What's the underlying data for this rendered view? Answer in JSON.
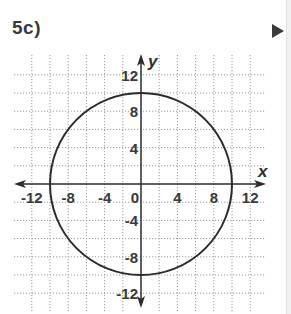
{
  "problem": {
    "label": "5c)"
  },
  "navigation": {
    "next_icon": "play-triangle-icon"
  },
  "chart_data": {
    "type": "line",
    "title": "5c)",
    "subtitle": "",
    "xlabel": "x",
    "ylabel": "y",
    "xlim": [
      -12,
      12
    ],
    "ylim": [
      -12,
      12
    ],
    "grid": true,
    "grid_step": 2,
    "x_ticks": [
      -12,
      -8,
      -4,
      0,
      4,
      8,
      12
    ],
    "x_tick_labels": [
      "-12",
      "-8",
      "-4",
      "0",
      "4",
      "8",
      "12"
    ],
    "y_ticks": [
      12,
      8,
      4,
      -4,
      -8,
      -12
    ],
    "y_tick_labels": [
      "12",
      "8",
      "4",
      "-4",
      "-8",
      "-12"
    ],
    "series": [
      {
        "name": "circle",
        "shape": "circle",
        "center": [
          0,
          0
        ],
        "radius": 10,
        "equation": "x^2 + y^2 = 100",
        "key_points": [
          [
            10,
            0
          ],
          [
            0,
            10
          ],
          [
            -10,
            0
          ],
          [
            0,
            -10
          ]
        ],
        "color": "#2b2b2b"
      }
    ],
    "legend": null
  },
  "colors": {
    "grid": "#9a9a9a",
    "axis": "#2b2b2b",
    "curve": "#2b2b2b",
    "text": "#3a3a3a"
  }
}
